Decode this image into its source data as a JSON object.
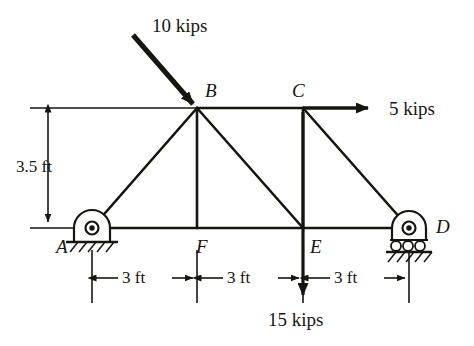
{
  "figure": {
    "type": "truss-free-body-diagram",
    "stroke_color": "#17150f",
    "background": "#ffffff"
  },
  "joints": [
    {
      "id": "A",
      "label": "A",
      "x": 92,
      "y": 228,
      "support": "pin",
      "label_x": 56,
      "label_y": 237
    },
    {
      "id": "B",
      "label": "B",
      "x": 197,
      "y": 108,
      "support": "none",
      "label_x": 205,
      "label_y": 81
    },
    {
      "id": "C",
      "label": "C",
      "x": 303,
      "y": 108,
      "support": "none",
      "label_x": 292,
      "label_y": 81
    },
    {
      "id": "D",
      "label": "D",
      "x": 409,
      "y": 228,
      "support": "roller",
      "label_x": 436,
      "label_y": 217
    },
    {
      "id": "E",
      "label": "E",
      "x": 303,
      "y": 228,
      "support": "none",
      "label_x": 310,
      "label_y": 237
    },
    {
      "id": "F",
      "label": "F",
      "x": 197,
      "y": 228,
      "support": "none",
      "label_x": 196,
      "label_y": 237
    }
  ],
  "members": [
    {
      "from": "A",
      "to": "B"
    },
    {
      "from": "A",
      "to": "F"
    },
    {
      "from": "F",
      "to": "E"
    },
    {
      "from": "E",
      "to": "D"
    },
    {
      "from": "B",
      "to": "C"
    },
    {
      "from": "B",
      "to": "F"
    },
    {
      "from": "B",
      "to": "E"
    },
    {
      "from": "C",
      "to": "E"
    },
    {
      "from": "C",
      "to": "D"
    }
  ],
  "loads": [
    {
      "id": "load-10-kips",
      "label": "10 kips",
      "magnitude": 10,
      "unit": "kips",
      "applied_at": "B",
      "direction": "down-right-diagonal",
      "from_x": 133,
      "from_y": 35,
      "to_x": 195,
      "to_y": 106,
      "label_x": 152,
      "label_y": 16
    },
    {
      "id": "load-5-kips",
      "label": "5 kips",
      "magnitude": 5,
      "unit": "kips",
      "applied_at": "C",
      "direction": "right-horizontal",
      "from_x": 303,
      "from_y": 108,
      "to_x": 374,
      "to_y": 108,
      "label_x": 389,
      "label_y": 99
    },
    {
      "id": "load-15-kips",
      "label": "15 kips",
      "magnitude": 15,
      "unit": "kips",
      "applied_at": "E",
      "direction": "down-vertical",
      "from_x": 303,
      "from_y": 108,
      "to_x": 303,
      "to_y": 301,
      "label_x": 268,
      "label_y": 310
    }
  ],
  "dimensions": {
    "vertical": {
      "id": "height-dimension",
      "label": "3.5 ft",
      "value": 3.5,
      "unit": "ft",
      "x": 48,
      "top_y": 110,
      "bottom_y": 224,
      "label_x": 16,
      "label_y": 158
    },
    "horizontal": [
      {
        "id": "span-A-F",
        "label": "3 ft",
        "value": 3,
        "unit": "ft",
        "from_x": 92,
        "to_x": 197,
        "y": 278,
        "label_x": 122,
        "label_y": 269
      },
      {
        "id": "span-F-E",
        "label": "3 ft",
        "value": 3,
        "unit": "ft",
        "from_x": 197,
        "to_x": 303,
        "y": 278,
        "label_x": 227,
        "label_y": 269
      },
      {
        "id": "span-E-D",
        "label": "3 ft",
        "value": 3,
        "unit": "ft",
        "from_x": 303,
        "to_x": 409,
        "y": 278,
        "label_x": 334,
        "label_y": 269
      }
    ],
    "extension_lines": [
      {
        "x": 92,
        "from_y": 248,
        "to_y": 303
      },
      {
        "x": 197,
        "from_y": 248,
        "to_y": 303
      },
      {
        "x": 303,
        "from_y": 248,
        "to_y": 303
      },
      {
        "x": 409,
        "from_y": 248,
        "to_y": 303
      }
    ],
    "top_reference_line": {
      "from_x": 30,
      "to_x": 197,
      "y": 108
    },
    "bottom_reference_line": {
      "from_x": 30,
      "to_x": 92,
      "y": 228
    }
  }
}
